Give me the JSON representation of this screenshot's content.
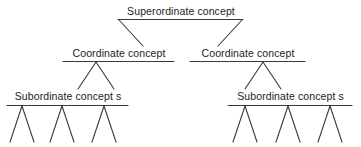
{
  "diagram": {
    "background_color": "#ffffff",
    "line_color": "#3a3a3a",
    "text_color": "#1b1b1b",
    "levels": [
      {
        "level": 1,
        "nodes": [
          {
            "id": "superordinate",
            "label": "Superordinate concept"
          }
        ]
      },
      {
        "level": 2,
        "nodes": [
          {
            "id": "coordinate-left",
            "label": "Coordinate concept"
          },
          {
            "id": "coordinate-right",
            "label": "Coordinate concept"
          }
        ]
      },
      {
        "level": 3,
        "nodes": [
          {
            "id": "subordinate-left",
            "label": "Subordinate concept s"
          },
          {
            "id": "subordinate-right",
            "label": "Subordinate concept s"
          }
        ]
      }
    ],
    "leaf_forks": {
      "count_per_group": 3,
      "groups": [
        "subordinate-left",
        "subordinate-right"
      ]
    }
  }
}
